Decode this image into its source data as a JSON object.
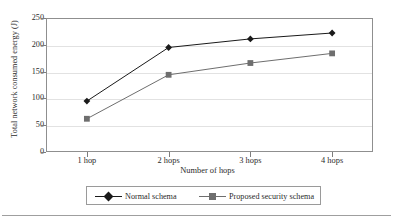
{
  "chart_data": {
    "type": "line",
    "title": "",
    "xlabel": "Number of hops",
    "ylabel": "Total network consumed energy (J)",
    "categories": [
      "1 hop",
      "2 hops",
      "3 hops",
      "4 hops"
    ],
    "yticks": [
      250,
      200,
      150,
      100,
      50,
      0
    ],
    "ylim": [
      0,
      250
    ],
    "grid": true,
    "legend_position": "bottom",
    "series": [
      {
        "name": "Normal schema",
        "marker": "diamond",
        "color": "#1a1a1a",
        "values": [
          95,
          195,
          211,
          222
        ]
      },
      {
        "name": "Proposed security schema",
        "marker": "square",
        "color": "#6e6e6e",
        "values": [
          62,
          144,
          166,
          184
        ]
      }
    ]
  },
  "legend": {
    "items": [
      {
        "label": "Normal schema"
      },
      {
        "label": "Proposed security schema"
      }
    ]
  }
}
